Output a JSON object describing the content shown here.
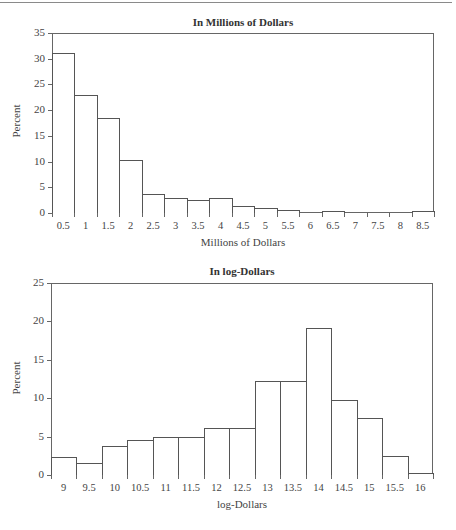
{
  "chart_data": [
    {
      "type": "bar",
      "title": "In Millions of Dollars",
      "xlabel": "Millions of Dollars",
      "ylabel": "Percent",
      "ylim": [
        0,
        35
      ],
      "yticks": [
        "0",
        "5",
        "10",
        "15",
        "20",
        "25",
        "30",
        "35"
      ],
      "categories": [
        "0.5",
        "1",
        "1.5",
        "2",
        "2.5",
        "3",
        "3.5",
        "4",
        "4.5",
        "5",
        "5.5",
        "6",
        "6.5",
        "7",
        "7.5",
        "8",
        "8.5"
      ],
      "values": [
        31.1,
        23.0,
        18.5,
        10.3,
        3.7,
        2.9,
        2.5,
        2.9,
        1.4,
        0.9,
        0.5,
        0.0,
        0.3,
        0.0,
        0.0,
        0.0,
        0.4
      ],
      "grid": false,
      "legend": null
    },
    {
      "type": "bar",
      "title": "In log-Dollars",
      "xlabel": "log-Dollars",
      "ylabel": "Percent",
      "ylim": [
        0,
        25
      ],
      "yticks": [
        "0",
        "5",
        "10",
        "15",
        "20",
        "25"
      ],
      "categories": [
        "9",
        "9.5",
        "10",
        "10.5",
        "11",
        "11.5",
        "12",
        "12.5",
        "13",
        "13.5",
        "14",
        "14.5",
        "15",
        "15.5",
        "16"
      ],
      "values": [
        2.3,
        1.5,
        3.8,
        4.5,
        4.9,
        4.9,
        6.1,
        6.1,
        12.2,
        12.2,
        19.1,
        9.8,
        7.4,
        2.5,
        0.3
      ],
      "grid": false,
      "legend": null
    }
  ],
  "colors": {
    "bar_fill": "#ffffff",
    "bar_stroke": "#555555",
    "axis": "#666666",
    "text": "#333333"
  }
}
